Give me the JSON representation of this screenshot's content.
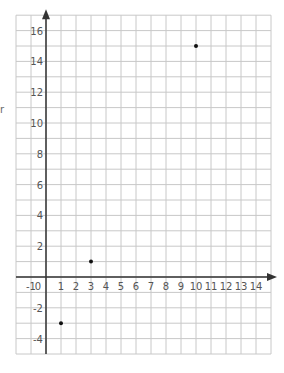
{
  "chart_data": {
    "type": "scatter",
    "title": "",
    "xlabel": "",
    "ylabel": "",
    "xlim": [
      -2,
      15
    ],
    "ylim": [
      -5,
      17
    ],
    "grid": true,
    "x_ticks": [
      -1,
      0,
      1,
      2,
      3,
      4,
      5,
      6,
      7,
      8,
      9,
      10,
      11,
      12,
      13,
      14
    ],
    "x_tick_labels": [
      "-1",
      "0",
      "1",
      "2",
      "3",
      "4",
      "5",
      "6",
      "7",
      "8",
      "9",
      "10",
      "11",
      "12",
      "13",
      "14"
    ],
    "y_ticks": [
      -4,
      -2,
      2,
      4,
      6,
      8,
      10,
      12,
      14,
      16
    ],
    "y_tick_labels": [
      "-4",
      "-2",
      "2",
      "4",
      "6",
      "8",
      "10",
      "12",
      "14",
      "16"
    ],
    "series": [
      {
        "name": "points",
        "x": [
          1,
          3,
          10
        ],
        "y": [
          -3,
          1,
          15
        ]
      }
    ],
    "legend": null
  },
  "colors": {
    "grid": "#c8c8c8",
    "axis": "#333333",
    "point": "#111111",
    "tick_text": "#555555"
  },
  "edge_fragment": "r"
}
